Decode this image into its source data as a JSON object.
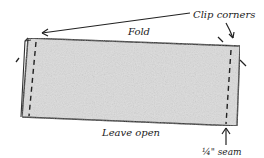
{
  "diagram": {
    "labels": {
      "fold": "Fold",
      "clip_corners": "Clip corners",
      "leave_open": "Leave open",
      "seam": "¼\" seam"
    },
    "colors": {
      "fabric_fill": "#d8d8d8",
      "outline": "#222222",
      "background": "#ffffff"
    }
  }
}
